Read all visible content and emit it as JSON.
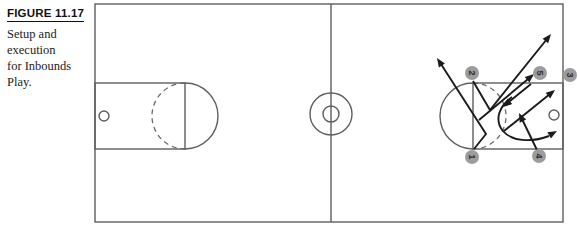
{
  "figure": {
    "label": "FIGURE 11.17",
    "caption_lines": [
      "Setup and",
      "execution",
      "for Inbounds",
      "Play."
    ]
  },
  "players": {
    "p1": "1",
    "p2": "2",
    "p3": "3",
    "p4": "4",
    "p5": "5"
  },
  "colors": {
    "court_line": "#5e5e5e",
    "play_line": "#1b1b1b",
    "marker_fill": "#9c9c9c",
    "marker_number": "#2e2e2e",
    "background": "#ffffff"
  }
}
